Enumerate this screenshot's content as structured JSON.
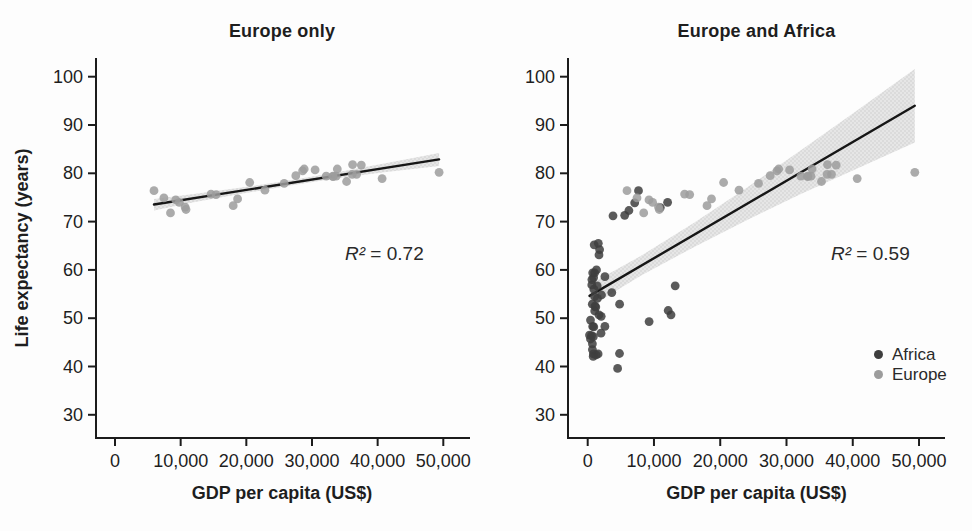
{
  "figure": {
    "background": "#fdfdfd",
    "axis_color": "#1c1c1c",
    "line_color": "#161616",
    "band_color": "#dedede",
    "band_dot_color": "#c6c6c6",
    "text_color": "#1e1e1e"
  },
  "chart_data": [
    {
      "type": "scatter",
      "title": "Europe only",
      "xlabel": "GDP per capita (US$)",
      "ylabel": "Life expectancy (years)",
      "xlim": [
        0,
        50000
      ],
      "ylim": [
        30,
        100
      ],
      "xticks": [
        0,
        10000,
        20000,
        30000,
        40000,
        50000
      ],
      "xtick_labels": [
        "0",
        "10,000",
        "20,000",
        "30,000",
        "40,000",
        "50,000"
      ],
      "yticks": [
        30,
        40,
        50,
        60,
        70,
        80,
        90,
        100
      ],
      "grid": false,
      "annotation": {
        "symbol": "R²",
        "value": " = 0.72"
      },
      "regression": {
        "x_start": 5937,
        "x_end": 49357,
        "intercept": 72.26,
        "slope": 0.000215
      },
      "confidence_band": [
        [
          5937,
          72.3,
          74.7
        ],
        [
          12000,
          74.0,
          75.7
        ],
        [
          19000,
          75.7,
          77.0
        ],
        [
          26000,
          77.3,
          78.4
        ],
        [
          33000,
          78.8,
          80.0
        ],
        [
          41000,
          80.2,
          82.0
        ],
        [
          49357,
          81.5,
          84.2
        ]
      ],
      "series": [
        {
          "name": "Europe",
          "color": "#9c9c9c",
          "points": [
            [
              5937,
              76.4
            ],
            [
              36126,
              79.8
            ],
            [
              33693,
              79.4
            ],
            [
              7446,
              74.9
            ],
            [
              10681,
              73.0
            ],
            [
              14619,
              75.7
            ],
            [
              22833,
              76.5
            ],
            [
              35278,
              78.3
            ],
            [
              33207,
              79.3
            ],
            [
              30470,
              80.7
            ],
            [
              32170,
              79.4
            ],
            [
              27538,
              79.5
            ],
            [
              18009,
              73.3
            ],
            [
              36181,
              81.8
            ],
            [
              40676,
              78.9
            ],
            [
              28570,
              80.5
            ],
            [
              9254,
              74.5
            ],
            [
              36798,
              79.8
            ],
            [
              49357,
              80.2
            ],
            [
              15390,
              75.6
            ],
            [
              20510,
              78.1
            ],
            [
              10808,
              72.5
            ],
            [
              9787,
              74.0
            ],
            [
              18678,
              74.7
            ],
            [
              25768,
              77.9
            ],
            [
              28821,
              80.9
            ],
            [
              33860,
              80.9
            ],
            [
              37506,
              81.7
            ],
            [
              8458,
              71.8
            ],
            [
              33203,
              79.4
            ]
          ]
        }
      ]
    },
    {
      "type": "scatter",
      "title": "Europe and Africa",
      "xlabel": "GDP per capita (US$)",
      "ylabel": "Life expectancy (years)",
      "xlim": [
        0,
        50000
      ],
      "ylim": [
        30,
        100
      ],
      "xticks": [
        0,
        10000,
        20000,
        30000,
        40000,
        50000
      ],
      "xtick_labels": [
        "0",
        "10,000",
        "20,000",
        "30,000",
        "40,000",
        "50,000"
      ],
      "yticks": [
        30,
        40,
        50,
        60,
        70,
        80,
        90,
        100
      ],
      "grid": false,
      "annotation": {
        "symbol": "R²",
        "value": " = 0.59"
      },
      "regression": {
        "x_start": 278,
        "x_end": 49357,
        "intercept": 54.4,
        "slope": 0.000802
      },
      "confidence_band": [
        [
          278,
          52.3,
          57.0
        ],
        [
          8000,
          58.8,
          62.9
        ],
        [
          16000,
          64.7,
          69.7
        ],
        [
          24000,
          70.3,
          77.0
        ],
        [
          32000,
          75.6,
          84.6
        ],
        [
          40000,
          80.6,
          92.4
        ],
        [
          49357,
          86.4,
          101.6
        ]
      ],
      "legend": {
        "position": "lower right"
      },
      "series": [
        {
          "name": "Africa",
          "color": "#3e3e3e",
          "points": [
            [
              6223,
              72.3
            ],
            [
              4797,
              42.7
            ],
            [
              1441,
              56.7
            ],
            [
              12570,
              50.7
            ],
            [
              1217,
              52.3
            ],
            [
              430,
              49.6
            ],
            [
              2042,
              50.4
            ],
            [
              706,
              44.7
            ],
            [
              1704,
              50.7
            ],
            [
              986,
              65.2
            ],
            [
              278,
              46.5
            ],
            [
              3633,
              55.3
            ],
            [
              2602,
              48.3
            ],
            [
              2082,
              54.8
            ],
            [
              5581,
              71.3
            ],
            [
              12154,
              51.6
            ],
            [
              641,
              58.0
            ],
            [
              690,
              52.9
            ],
            [
              13206,
              56.7
            ],
            [
              753,
              59.4
            ],
            [
              1328,
              60.0
            ],
            [
              942,
              56.0
            ],
            [
              579,
              46.4
            ],
            [
              1463,
              54.1
            ],
            [
              1569,
              42.6
            ],
            [
              415,
              45.7
            ],
            [
              12057,
              74.0
            ],
            [
              1045,
              59.4
            ],
            [
              759,
              48.3
            ],
            [
              1043,
              54.5
            ],
            [
              1803,
              64.2
            ],
            [
              10957,
              72.9
            ],
            [
              3820,
              71.2
            ],
            [
              823,
              42.1
            ],
            [
              4811,
              52.9
            ],
            [
              619,
              56.9
            ],
            [
              2014,
              46.9
            ],
            [
              7670,
              76.4
            ],
            [
              863,
              46.2
            ],
            [
              1598,
              65.5
            ],
            [
              1712,
              63.1
            ],
            [
              862,
              42.6
            ],
            [
              926,
              48.2
            ],
            [
              9270,
              49.3
            ],
            [
              2602,
              58.6
            ],
            [
              4513,
              39.6
            ],
            [
              1107,
              52.5
            ],
            [
              883,
              58.4
            ],
            [
              7093,
              73.9
            ],
            [
              1056,
              51.5
            ],
            [
              1271,
              42.4
            ],
            [
              706,
              43.5
            ]
          ]
        },
        {
          "name": "Europe",
          "color": "#9c9c9c",
          "points": [
            [
              5937,
              76.4
            ],
            [
              36126,
              79.8
            ],
            [
              33693,
              79.4
            ],
            [
              7446,
              74.9
            ],
            [
              10681,
              73.0
            ],
            [
              14619,
              75.7
            ],
            [
              22833,
              76.5
            ],
            [
              35278,
              78.3
            ],
            [
              33207,
              79.3
            ],
            [
              30470,
              80.7
            ],
            [
              32170,
              79.4
            ],
            [
              27538,
              79.5
            ],
            [
              18009,
              73.3
            ],
            [
              36181,
              81.8
            ],
            [
              40676,
              78.9
            ],
            [
              28570,
              80.5
            ],
            [
              9254,
              74.5
            ],
            [
              36798,
              79.8
            ],
            [
              49357,
              80.2
            ],
            [
              15390,
              75.6
            ],
            [
              20510,
              78.1
            ],
            [
              10808,
              72.5
            ],
            [
              9787,
              74.0
            ],
            [
              18678,
              74.7
            ],
            [
              25768,
              77.9
            ],
            [
              28821,
              80.9
            ],
            [
              33860,
              80.9
            ],
            [
              37506,
              81.7
            ],
            [
              8458,
              71.8
            ],
            [
              33203,
              79.4
            ]
          ]
        }
      ]
    }
  ]
}
